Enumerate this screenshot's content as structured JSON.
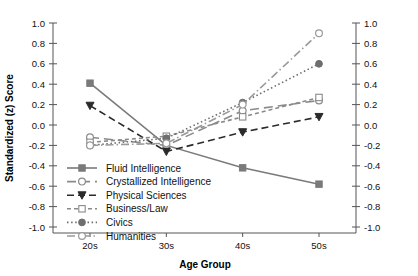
{
  "chart_data": {
    "type": "line",
    "title": "",
    "xlabel": "Age Group",
    "ylabel": "Standardized (z) Score",
    "categories": [
      "20s",
      "30s",
      "40s",
      "50s"
    ],
    "ylim": [
      -1.0,
      1.0
    ],
    "yticks": [
      "1.0",
      "0.8",
      "0.6",
      "0.4",
      "0.2",
      "0.0",
      "-0.2",
      "-0.4",
      "-0.6",
      "-0.8",
      "-1.0"
    ],
    "ytick_values": [
      1.0,
      0.8,
      0.6,
      0.4,
      0.2,
      0.0,
      -0.2,
      -0.4,
      -0.6,
      -0.8,
      -1.0
    ],
    "grid": false,
    "legend_position": "lower-left inside",
    "right_axis_mirrored": true,
    "series": [
      {
        "name": "Fluid Intelligence",
        "values": [
          0.41,
          -0.2,
          -0.42,
          -0.58
        ],
        "marker": "filled-square",
        "dash": "solid",
        "color": "#7a7a7a"
      },
      {
        "name": "Crystallized Intelligence",
        "values": [
          -0.12,
          -0.2,
          0.14,
          0.24
        ],
        "marker": "open-circle",
        "dash": "long-dash",
        "color": "#8a8a8a"
      },
      {
        "name": "Physical Sciences",
        "values": [
          0.19,
          -0.26,
          -0.07,
          0.08
        ],
        "marker": "filled-triangle-down",
        "dash": "dash",
        "color": "#2b2b2b"
      },
      {
        "name": "Business/Law",
        "values": [
          -0.17,
          -0.11,
          0.08,
          0.27
        ],
        "marker": "open-square",
        "dash": "short-dash",
        "color": "#8a8a8a"
      },
      {
        "name": "Civics",
        "values": [
          -0.2,
          -0.13,
          0.22,
          0.6
        ],
        "marker": "filled-circle",
        "dash": "dotted",
        "color": "#6e6e6e"
      },
      {
        "name": "Humanities",
        "values": [
          -0.2,
          -0.18,
          0.2,
          0.9
        ],
        "marker": "open-circle",
        "dash": "dash-dot",
        "color": "#9a9a9a"
      }
    ]
  },
  "axis": {
    "x_title": "Age Group",
    "y_title": "Standardized (z) Score"
  }
}
